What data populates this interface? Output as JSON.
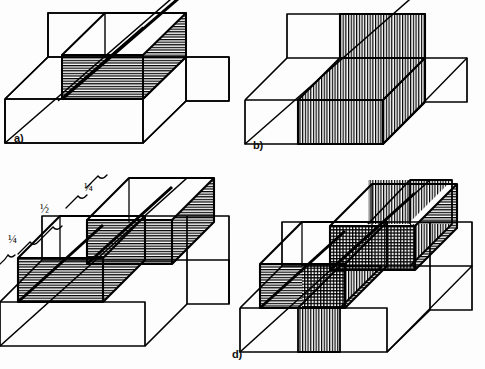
{
  "figure": {
    "background_color": "#fdfdfd",
    "line_color": "#000000",
    "hatch_color": "#000000",
    "panel_count": 4,
    "projection": "oblique"
  },
  "panels": [
    {
      "id": "a",
      "label": "a)",
      "label_x": 14,
      "label_y": 140,
      "hatch_style": "horizontal",
      "description": "Box with horizontally hatched middle slab spanning full height",
      "fraction_annotations": []
    },
    {
      "id": "b",
      "label": "b)",
      "label_x": 253,
      "label_y": 146,
      "hatch_style": "vertical",
      "description": "Box with vertically hatched middle slab spanning full height and depth",
      "fraction_annotations": []
    },
    {
      "id": "c",
      "label": "c)",
      "label_x": 3,
      "label_y": 330,
      "hatch_style": "horizontal",
      "description": "Box with two offset horizontally hatched half-blocks forming a staircase",
      "fraction_annotations": [
        {
          "text": "¼",
          "x": 8,
          "y": 238
        },
        {
          "text": "½",
          "x": 38,
          "y": 208
        },
        {
          "text": "¼",
          "x": 82,
          "y": 186
        }
      ]
    },
    {
      "id": "d",
      "label": "d)",
      "label_x": 232,
      "label_y": 348,
      "hatch_style": "cross",
      "description": "Box combining horizontal staircase hatch with vertical slab hatch, producing cross-hatched overlap",
      "fraction_annotations": []
    }
  ],
  "legend": {
    "horizontal_hatch_meaning": "horizontal section",
    "vertical_hatch_meaning": "vertical section",
    "cross_hatch_meaning": "intersection of both sections"
  }
}
